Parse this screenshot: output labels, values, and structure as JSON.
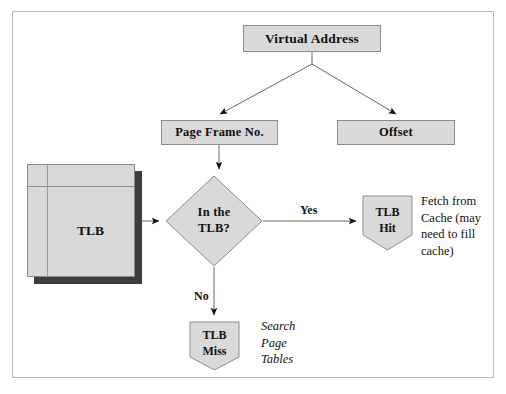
{
  "diagram": {
    "nodes": {
      "virtual_address": {
        "label": "Virtual Address",
        "shape": "rectangle"
      },
      "page_frame_no": {
        "label": "Page Frame No.",
        "shape": "rectangle"
      },
      "offset": {
        "label": "Offset",
        "shape": "rectangle"
      },
      "tlb": {
        "label": "TLB",
        "shape": "table-stack"
      },
      "decision": {
        "line1": "In the",
        "line2": "TLB?",
        "shape": "diamond"
      },
      "tlb_hit": {
        "line1": "TLB",
        "line2": "Hit",
        "shape": "shield"
      },
      "tlb_miss": {
        "line1": "TLB",
        "line2": "Miss",
        "shape": "shield"
      }
    },
    "edge_labels": {
      "yes": "Yes",
      "no": "No"
    },
    "annotations": {
      "fetch_from_cache": "Fetch from Cache (may need to fill cache)",
      "search_page_tables": "Search Page Tables"
    },
    "colors": {
      "node_fill": "#d9d9d9",
      "node_stroke": "#8d8d8d",
      "shadow": "#3d3d3d",
      "line": "#555555",
      "frame": "#b9b9b9",
      "text": "#111111"
    }
  }
}
